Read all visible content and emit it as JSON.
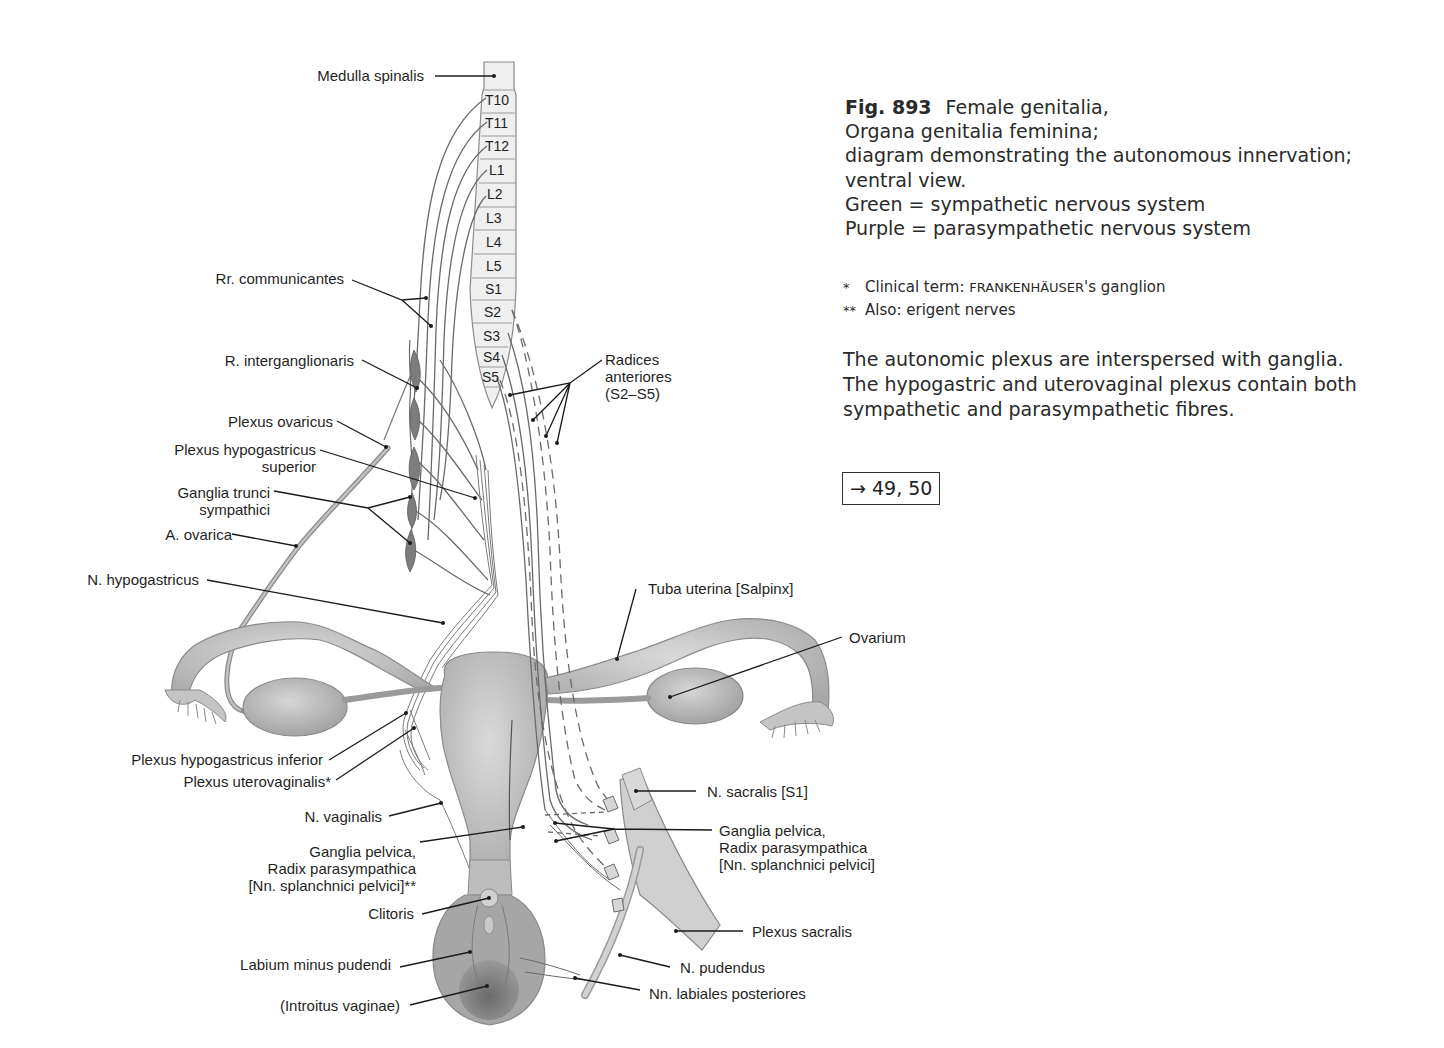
{
  "caption": {
    "figure_number": "Fig. 893",
    "title": "Female genitalia,",
    "lines": [
      "Organa genitalia feminina;",
      "diagram demonstrating the autonomous innervation;",
      "ventral view.",
      "Green = sympathetic nervous system",
      "Purple = parasympathetic nervous system"
    ]
  },
  "footnotes": [
    {
      "mark": "*",
      "text": "Clinical term: ",
      "smallcaps": "FRANKENHÄUSER",
      "suffix": "'s ganglion"
    },
    {
      "mark": "**",
      "text": "Also: erigent nerves"
    }
  ],
  "body_text": [
    "The autonomic plexus are interspersed with ganglia.",
    "The hypogastric and uterovaginal plexus contain both",
    "sympathetic and parasympathetic fibres."
  ],
  "cross_reference": {
    "arrow": "→",
    "pages": "49, 50"
  },
  "spinal_segments": [
    "T10",
    "T11",
    "T12",
    "L1",
    "L2",
    "L3",
    "L4",
    "L5",
    "S1",
    "S2",
    "S3",
    "S4",
    "S5"
  ],
  "labels_left": {
    "medulla_spinalis": "Medulla spinalis",
    "rr_communicantes": "Rr. communicantes",
    "r_interganglionaris": "R. interganglionaris",
    "plexus_ovaricus": "Plexus ovaricus",
    "plexus_hypogastricus_superior_1": "Plexus hypogastricus",
    "plexus_hypogastricus_superior_2": "superior",
    "ganglia_trunci_1": "Ganglia trunci",
    "ganglia_trunci_2": "sympathici",
    "a_ovarica": "A. ovarica",
    "n_hypogastricus": "N. hypogastricus",
    "plexus_hypogastricus_inferior": "Plexus hypogastricus inferior",
    "plexus_uterovaginalis": "Plexus uterovaginalis*",
    "n_vaginalis": "N. vaginalis",
    "ganglia_pelvica_l1": "Ganglia pelvica,",
    "ganglia_pelvica_l2": "Radix parasympathica",
    "ganglia_pelvica_l3": "[Nn. splanchnici pelvici]**",
    "clitoris": "Clitoris",
    "labium_minus": "Labium minus pudendi",
    "introitus": "(Introitus vaginae)"
  },
  "labels_right": {
    "radices_1": "Radices",
    "radices_2": "anteriores",
    "radices_3": "(S2–S5)",
    "tuba_uterina": "Tuba uterina [Salpinx]",
    "ovarium": "Ovarium",
    "n_sacralis": "N. sacralis [S1]",
    "ganglia_pelvica_l1": "Ganglia pelvica,",
    "ganglia_pelvica_l2": "Radix parasympathica",
    "ganglia_pelvica_l3": "[Nn. splanchnici pelvici]",
    "plexus_sacralis": "Plexus sacralis",
    "n_pudendus": "N. pudendus",
    "nn_labiales": "Nn. labiales posteriores"
  },
  "colors": {
    "organ_fill": "#c4c4c4",
    "organ_stroke": "#8a8a8a",
    "nerve": "#6a6a6a",
    "ganglion": "#7d7d7d",
    "leader": "#1a1a1a",
    "cord_fill": "#eeeeee"
  }
}
